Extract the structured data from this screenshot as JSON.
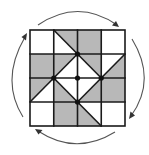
{
  "diagram": {
    "title": "",
    "grid": {
      "rows": 4,
      "cols": 4,
      "origin": [
        30,
        30
      ],
      "size": [
        95,
        96
      ]
    },
    "colors": {
      "shade": "#b8b8b8",
      "blank": "#ffffff",
      "line": "#1a1a1a",
      "arrow": "#555555"
    },
    "full_cells": [
      {
        "col": 0,
        "row": 0,
        "fill": "white"
      },
      {
        "col": 2,
        "row": 0,
        "fill": "gray"
      },
      {
        "col": 3,
        "row": 0,
        "fill": "white"
      },
      {
        "col": 0,
        "row": 1,
        "fill": "gray"
      },
      {
        "col": 3,
        "row": 2,
        "fill": "gray"
      },
      {
        "col": 0,
        "row": 3,
        "fill": "white"
      },
      {
        "col": 1,
        "row": 3,
        "fill": "gray"
      },
      {
        "col": 3,
        "row": 3,
        "fill": "white"
      }
    ],
    "split_cells": [
      {
        "col": 1,
        "row": 0,
        "diagonal": "(1,0)-(2,1)",
        "gray_half": "upper-right"
      },
      {
        "col": 1,
        "row": 1,
        "diagonal": "(2,1)-(1,2)",
        "gray_half": "upper-left"
      },
      {
        "col": 2,
        "row": 1,
        "diagonal": "(2,1)-(3,2)",
        "gray_half": "upper-right"
      },
      {
        "col": 3,
        "row": 1,
        "diagonal": "(4,1)-(3,2)",
        "gray_half": "lower-right"
      },
      {
        "col": 0,
        "row": 2,
        "diagonal": "(1,2)-(0,3)",
        "gray_half": "upper-left"
      },
      {
        "col": 1,
        "row": 2,
        "diagonal": "(1,2)-(2,3)",
        "gray_half": "lower-left"
      },
      {
        "col": 2,
        "row": 2,
        "diagonal": "(3,2)-(2,3)",
        "gray_half": "lower-right"
      },
      {
        "col": 2,
        "row": 3,
        "diagonal": "(2,3)-(3,4)",
        "gray_half": "lower-left"
      }
    ],
    "dots": [
      {
        "x": 2,
        "y": 1
      },
      {
        "x": 1,
        "y": 2
      },
      {
        "x": 2,
        "y": 2
      },
      {
        "x": 3,
        "y": 2
      },
      {
        "x": 2,
        "y": 3
      }
    ],
    "rotation_arrows": {
      "direction": "clockwise",
      "count": 4,
      "positions": [
        "top",
        "right",
        "bottom",
        "left"
      ]
    }
  }
}
